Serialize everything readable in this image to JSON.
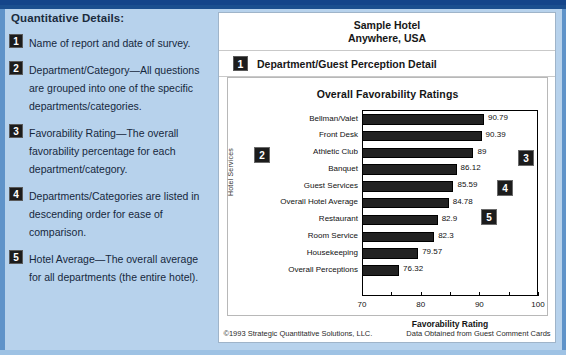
{
  "left_panel": {
    "title": "Quantitative Details:",
    "items": [
      {
        "num": "1",
        "text": "Name of report and date of survey."
      },
      {
        "num": "2",
        "text": "Department/Category—All questions are grouped into one of the specific departments/categories."
      },
      {
        "num": "3",
        "text": "Favorability Rating—The overall favorability percentage for each department/category."
      },
      {
        "num": "4",
        "text": "Departments/Categories are listed in descending order for ease of comparison."
      },
      {
        "num": "5",
        "text": "Hotel Average—The overall average for all departments (the entire hotel)."
      }
    ]
  },
  "report": {
    "header_line1": "Sample Hotel",
    "header_line2": "Anywhere, USA",
    "subheader_badge": "1",
    "subheader": "Department/Guest Perception Detail",
    "footer_left": "©1993 Strategic Quantitative Solutions, LLC.",
    "footer_right": "Data Obtained from Guest Comment Cards",
    "callouts": [
      {
        "num": "2"
      },
      {
        "num": "3"
      },
      {
        "num": "4"
      },
      {
        "num": "5"
      }
    ]
  },
  "chart_data": {
    "type": "bar",
    "orientation": "horizontal",
    "title": "Overall Favorability Ratings",
    "xlabel": "Favorability Rating",
    "ylabel": "Hotel Services",
    "xlim": [
      70,
      100
    ],
    "xticks": [
      70,
      75,
      80,
      85,
      90,
      95,
      100
    ],
    "xtick_labels": [
      "70",
      "",
      "80",
      "",
      "90",
      "",
      "100"
    ],
    "grid": false,
    "legend": "none",
    "categories": [
      "Bellman/Valet",
      "Front Desk",
      "Athletic Club",
      "Banquet",
      "Guest Services",
      "Overall Hotel Average",
      "Restaurant",
      "Room Service",
      "Housekeeping",
      "Overall Perceptions"
    ],
    "values": [
      90.79,
      90.39,
      89,
      86.12,
      85.59,
      84.78,
      82.9,
      82.3,
      79.57,
      76.32
    ],
    "value_labels": [
      "90.79",
      "90.39",
      "89",
      "86.12",
      "85.59",
      "84.78",
      "82.9",
      "82.3",
      "79.57",
      "76.32"
    ],
    "bar_color": "#222222"
  },
  "colors": {
    "page_background": "#b7d2ec",
    "top_band": "#1b4f8f",
    "report_background": "#ffffff",
    "badge": "#1c1c1c",
    "text": "#16283c"
  }
}
